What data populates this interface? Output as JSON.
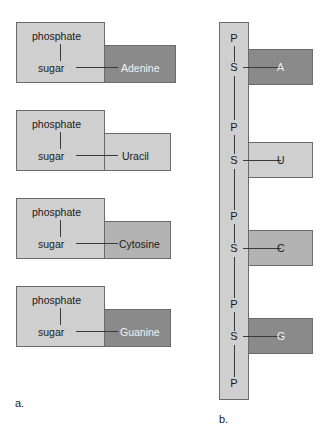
{
  "figure": {
    "panels": [
      {
        "id": "a",
        "label": "a."
      },
      {
        "id": "b",
        "label": "b."
      }
    ]
  },
  "colors": {
    "base_dark": "#8a8a8a",
    "base_mid": "#b3b3b3",
    "base_light": "#cfcfcf",
    "sugar_phosphate": "#cfcfcf",
    "outline": "#6b6b6b",
    "background": "#ffffff"
  },
  "panel_a": {
    "nucleotides": [
      {
        "phosphate_label": "phosphate",
        "sugar_label": "sugar",
        "base_label": "Adenine",
        "base_shade": "dark"
      },
      {
        "phosphate_label": "phosphate",
        "sugar_label": "sugar",
        "base_label": "Uracil",
        "base_shade": "light"
      },
      {
        "phosphate_label": "phosphate",
        "sugar_label": "sugar",
        "base_label": "Cytosine",
        "base_shade": "mid"
      },
      {
        "phosphate_label": "phosphate",
        "sugar_label": "sugar",
        "base_label": "Guanine",
        "base_shade": "dark"
      }
    ]
  },
  "panel_b": {
    "backbone_units": [
      {
        "phosphate_letter": "P",
        "sugar_letter": "S",
        "base_letter": "A",
        "base_shade": "dark"
      },
      {
        "phosphate_letter": "P",
        "sugar_letter": "S",
        "base_letter": "U",
        "base_shade": "light"
      },
      {
        "phosphate_letter": "P",
        "sugar_letter": "S",
        "base_letter": "C",
        "base_shade": "mid"
      },
      {
        "phosphate_letter": "P",
        "sugar_letter": "S",
        "base_letter": "G",
        "base_shade": "dark"
      }
    ],
    "terminal_phosphate_letter": "P"
  }
}
